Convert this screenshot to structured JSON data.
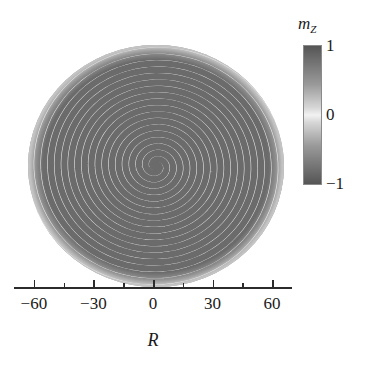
{
  "chart_data": {
    "type": "heatmap",
    "title": "",
    "subtitle": "",
    "xlabel": "R",
    "ylabel": "",
    "xlim": [
      -70,
      70
    ],
    "ylim": [
      -70,
      70
    ],
    "grid": false,
    "x_ticks": [
      -60,
      -30,
      0,
      30,
      60
    ],
    "x_tick_labels": [
      "−60",
      "−30",
      "0",
      "30",
      "60"
    ],
    "x_minor_ticks": [
      -45,
      -15,
      15,
      45
    ],
    "pattern": {
      "kind": "archimedean-spiral",
      "handedness": "counter-clockwise",
      "center": [
        0,
        0
      ],
      "disk_radius": 66,
      "band_pairs_per_radius": 10,
      "band_period": 6.4,
      "arms": 2
    },
    "colorbar": {
      "label": "m_z",
      "label_base": "m",
      "label_sub": "Z",
      "ticks": [
        1,
        0,
        -1
      ],
      "tick_labels": [
        "1",
        "0",
        "−1"
      ],
      "vmin": -1,
      "vmax": 1,
      "orientation": "vertical",
      "colormap": "gray-symmetric",
      "colors": {
        "value_plus1": "#555555",
        "value_zero": "#f2f2f2",
        "value_minus1": "#555555"
      }
    },
    "colors": {
      "background": "#ffffff",
      "axis": "#2b2b2b",
      "text": "#1a1a1a",
      "band_dark": "#6b6b6b",
      "band_light": "#e8e8e8"
    }
  }
}
